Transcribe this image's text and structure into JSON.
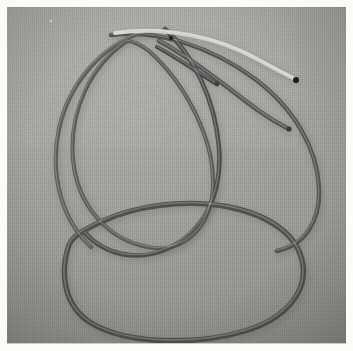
{
  "photo": {
    "title": "Tangled cables on gray fabric",
    "subject": "coiled electrical cords forming overlapping loops",
    "medium": "color photograph",
    "orientation": "square",
    "width_px": 353,
    "height_px": 351,
    "border": {
      "style": "white photographic print border",
      "color": "#fbfbfa",
      "thickness_px": 7,
      "hairline_color": "#c9c9c6"
    },
    "background": {
      "name": "gray woven fabric surface",
      "base_color": "#9b9b99",
      "highlight_color": "#a6a6a3",
      "shadow_color": "#8b8b88",
      "texture": "fine linen weave",
      "lighting": "soft diffuse light from upper left"
    },
    "palette": {
      "cable_dark": "#4a4a48",
      "cable_mid": "#6b6b68",
      "cable_light": "#cfcfca",
      "cable_white": "#e2e2dd",
      "tip_black": "#252524",
      "shadow": "rgba(40,40,38,0.30)"
    },
    "cables": [
      {
        "id": "cable-dark-bottom-loop",
        "label": "dark cable forming large bottom loop",
        "color": "#4f4f4d",
        "thickness_px": 5.4,
        "depth": "front",
        "path": "M 62 238 C 52 268 58 300 84 316 C 118 337 188 339 238 324 C 278 312 300 286 296 258 C 292 228 262 208 222 200 C 176 191 126 200 96 214 C 76 223 66 229 62 238 Z"
      },
      {
        "id": "cable-dark-upper-sweep",
        "label": "dark cable sweeping from upper-left across to right edge",
        "color": "#525250",
        "thickness_px": 4.4,
        "depth": "mid",
        "path": "M 104 28 C 150 22 205 40 248 72 C 288 102 310 142 312 180 C 314 214 298 238 270 244"
      },
      {
        "id": "cable-mid-left-arc",
        "label": "medium cable arcing down the left side",
        "color": "#5d5d5a",
        "thickness_px": 4.2,
        "depth": "mid",
        "path": "M 140 24 C 96 36 62 76 52 122 C 42 170 56 214 84 240"
      },
      {
        "id": "cable-mid-inner-loop",
        "label": "medium cable forming inner oval loop",
        "color": "#5a5a57",
        "thickness_px": 4.0,
        "depth": "mid",
        "path": "M 120 34 C 84 58 62 104 66 152 C 70 198 100 232 140 240 C 176 247 204 222 206 180 C 208 132 178 76 142 44 C 134 38 126 34 120 34 Z"
      },
      {
        "id": "cable-dark-diagonal",
        "label": "dark cable crossing diagonally through center",
        "color": "#4d4d4b",
        "thickness_px": 4.6,
        "depth": "mid",
        "path": "M 158 22 C 186 48 208 92 212 140 C 216 188 196 226 160 242 C 130 255 98 248 78 226"
      },
      {
        "id": "cable-light-top",
        "label": "pale cable arcing across the top with dark tip at right",
        "color": "#d2d2cd",
        "thickness_px": 4.0,
        "depth": "front",
        "path": "M 108 26 C 160 18 214 32 250 52 C 268 62 280 68 288 72"
      },
      {
        "id": "cable-gray-straight-end",
        "label": "gray cable with blunt cut end pointing right",
        "color": "#565654",
        "thickness_px": 4.6,
        "depth": "front",
        "path": "M 152 34 C 186 52 222 82 252 104 C 266 114 274 118 280 121"
      },
      {
        "id": "cable-short-stub",
        "label": "short dark cable stub near upper center",
        "color": "#4a4a48",
        "thickness_px": 4.2,
        "depth": "front",
        "path": "M 150 40 C 172 52 192 66 208 76"
      }
    ],
    "cable_ends": [
      {
        "id": "end-light-right",
        "label": "dark tip of pale cable",
        "x": 289,
        "y": 73,
        "color": "#1f1f1e",
        "radius_px": 3.0
      },
      {
        "id": "end-gray-right",
        "label": "cut end of gray cable",
        "x": 282,
        "y": 122,
        "color": "#3a3a38",
        "radius_px": 2.6
      },
      {
        "id": "end-stub-right",
        "label": "cut end of short stub",
        "x": 210,
        "y": 77,
        "color": "#3d3d3b",
        "radius_px": 2.4
      },
      {
        "id": "end-dark-top",
        "label": "small dark dot near top center",
        "x": 164,
        "y": 31,
        "color": "#242422",
        "radius_px": 2.2
      }
    ],
    "specks": [
      {
        "id": "speck-upper-left",
        "label": "small white lint speck",
        "x": 44,
        "y": 14,
        "size_px": 2.4,
        "color": "#e6e6e1"
      }
    ]
  }
}
